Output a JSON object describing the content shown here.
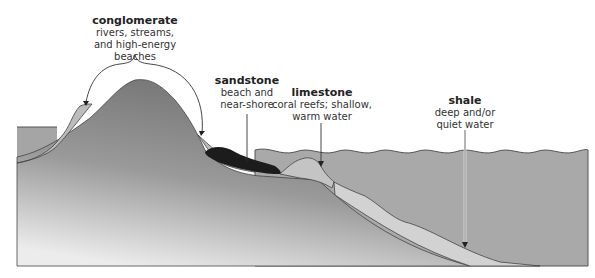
{
  "diagram": {
    "type": "geologic cross-section of sedimentary depositional environments",
    "labels": [
      {
        "id": "conglomerate",
        "title": "conglomerate",
        "lines": [
          "rivers, streams,",
          "and high-energy beaches"
        ]
      },
      {
        "id": "sandstone",
        "title": "sandstone",
        "lines": [
          "beach and",
          "near-shore"
        ]
      },
      {
        "id": "limestone",
        "title": "limestone",
        "lines": [
          "coral reefs; shallow,",
          "warm water"
        ]
      },
      {
        "id": "shale",
        "title": "shale",
        "lines": [
          "deep and/or",
          "quiet water"
        ]
      }
    ],
    "colors": {
      "bedrock_dark": "#7d7d7d",
      "bedrock_light": "#e6e6e6",
      "water": "#a8a8a8",
      "conglomerate": "#bdbdbd",
      "sandstone": "#1a1a1a",
      "limestone": "#c4c4c4",
      "shale_band": "#d0d0d0",
      "outline": "#444444"
    }
  }
}
